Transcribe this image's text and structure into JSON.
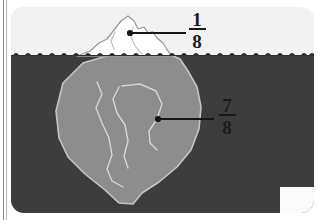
{
  "figure": {
    "name": "iceberg-fraction-diagram",
    "labels": [
      {
        "id": "above-water",
        "numerator": "1",
        "denominator": "8",
        "meaning": "portion of iceberg above the waterline",
        "dot": {
          "x": 130,
          "y": 33
        },
        "leader_end": {
          "x": 186,
          "y": 33
        }
      },
      {
        "id": "below-water",
        "numerator": "7",
        "denominator": "8",
        "meaning": "portion of iceberg below the waterline",
        "dot": {
          "x": 158,
          "y": 119
        },
        "leader_end": {
          "x": 214,
          "y": 119
        }
      }
    ],
    "colors": {
      "sky": "#f2f2f2",
      "water": "#3d3d3d",
      "iceberg_above": "#ffffff",
      "iceberg_below": "#8d8d8d",
      "iceberg_outline": "#bdbdbd",
      "tip_outline": "#9a9a9a",
      "crack_line": "#d8d8d8",
      "leader_line": "#161616",
      "label_text": "#1a1a1a",
      "page_background": "#ffffff",
      "edge_rule": "#8d8d8d"
    },
    "waterline": {
      "y": 55,
      "wave_count": 26,
      "description": "small dark wave ripples drawn along the surface of the water"
    }
  }
}
